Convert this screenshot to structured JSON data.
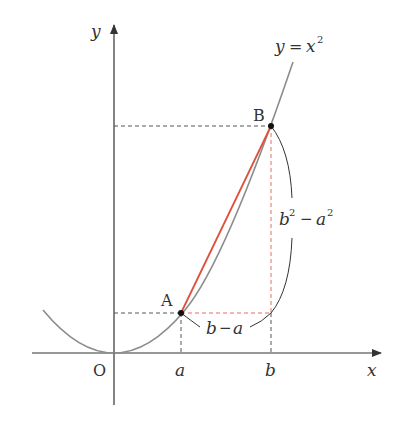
{
  "diagram": {
    "curve_label": "y = x²",
    "curve_label_parts": {
      "y": "y",
      "eq": "=",
      "x": "x",
      "exp": "2"
    },
    "axes": {
      "x_label": "x",
      "y_label": "y",
      "origin_label": "O"
    },
    "points": {
      "A": "A",
      "B": "B"
    },
    "ticks": {
      "a": "a",
      "b": "b"
    },
    "braces": {
      "horizontal": {
        "b": "b",
        "minus": "−",
        "a": "a"
      },
      "vertical": {
        "b": "b",
        "exp1": "2",
        "minus": "−",
        "a": "a",
        "exp2": "2"
      }
    },
    "colors": {
      "axis": "#333333",
      "curve": "#8c8c8c",
      "secant": "#e0503c",
      "guide_dashed": "#555555",
      "red_dashed": "#e07060",
      "point": "#111111"
    }
  }
}
